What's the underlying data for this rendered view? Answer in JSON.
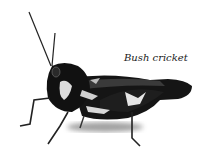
{
  "figure": {
    "caption": "Bush cricket",
    "colors": {
      "background": "#ffffff",
      "insect_dark": "#111111",
      "insect_mid": "#555555",
      "insect_light": "#e8e8e8",
      "caption_text": "#1a1a1a"
    }
  }
}
